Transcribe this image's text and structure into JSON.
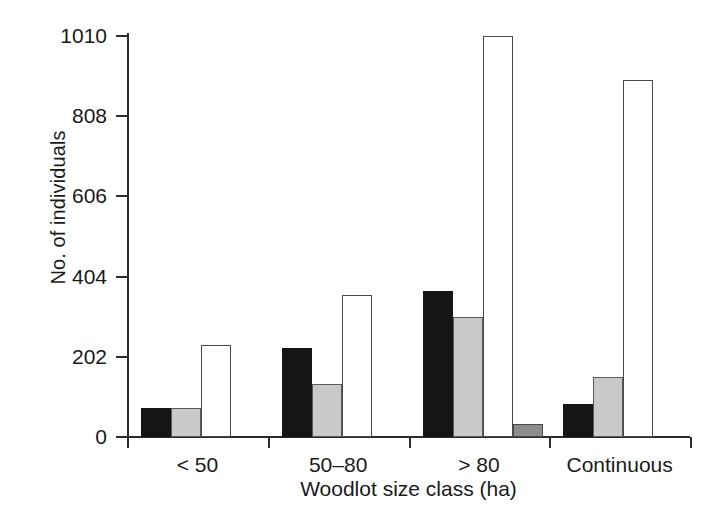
{
  "chart_data": {
    "type": "bar",
    "title": "",
    "xlabel": "Woodlot size class (ha)",
    "ylabel": "No. of individuals",
    "categories": [
      "< 50",
      "50–80",
      "> 80",
      "Continuous"
    ],
    "yticks": [
      0,
      202,
      404,
      606,
      808,
      1010
    ],
    "ytick_labels": [
      "0",
      "202",
      "404",
      "606",
      "808",
      "1010"
    ],
    "ylim": [
      0,
      1010
    ],
    "grid": false,
    "legend": "none",
    "series": [
      {
        "name": "black",
        "fill": "#151515",
        "values": [
          73,
          224,
          368,
          83
        ]
      },
      {
        "name": "light-gray",
        "fill": "#c9c9c9",
        "values": [
          73,
          133,
          302,
          151
        ]
      },
      {
        "name": "white",
        "fill": "#ffffff",
        "values": [
          232,
          358,
          1010,
          898
        ]
      },
      {
        "name": "dark-gray",
        "fill": "#8d8d8d",
        "values": [
          0,
          0,
          33,
          0
        ]
      }
    ],
    "bars": [
      {
        "group": "< 50",
        "series": "black",
        "value": 73
      },
      {
        "group": "< 50",
        "series": "light-gray",
        "value": 73
      },
      {
        "group": "< 50",
        "series": "white",
        "value": 232
      },
      {
        "group": "50–80",
        "series": "black",
        "value": 224
      },
      {
        "group": "50–80",
        "series": "light-gray",
        "value": 133
      },
      {
        "group": "50–80",
        "series": "white",
        "value": 358
      },
      {
        "group": "> 80",
        "series": "black",
        "value": 368
      },
      {
        "group": "> 80",
        "series": "light-gray",
        "value": 302
      },
      {
        "group": "> 80",
        "series": "white",
        "value": 1010
      },
      {
        "group": "> 80",
        "series": "dark-gray",
        "value": 33
      },
      {
        "group": "Continuous",
        "series": "black",
        "value": 83
      },
      {
        "group": "Continuous",
        "series": "light-gray",
        "value": 151
      },
      {
        "group": "Continuous",
        "series": "white",
        "value": 898
      }
    ]
  },
  "colors": {
    "axis": "#2b2b2b",
    "text": "#1a1a1a",
    "background": "#ffffff",
    "black_bar": "#151515",
    "gray_bar": "#c9c9c9",
    "dark_gray_bar": "#8d8d8d",
    "white_bar": "#ffffff"
  }
}
